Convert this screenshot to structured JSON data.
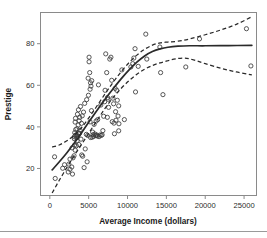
{
  "chart_data": {
    "type": "scatter",
    "title": "",
    "xlabel": "Average Income (dollars)",
    "ylabel": "Prestige",
    "xlim": [
      -1200,
      26600
    ],
    "ylim": [
      7,
      95
    ],
    "xticks": [
      0,
      5000,
      10000,
      15000,
      20000,
      25000
    ],
    "xtick_labels": [
      "0",
      "5000",
      "10000",
      "15000",
      "20000",
      "25000"
    ],
    "yticks": [
      20,
      40,
      60,
      80
    ],
    "ytick_labels": [
      "20",
      "40",
      "60",
      "80"
    ],
    "grid": false,
    "legend": "none",
    "marker": "open-circle",
    "point_color": "#3a3a3a",
    "fit_color": "#2a2a2a",
    "band_color": "#2a2a2a",
    "frame_color": "#8a8a8a",
    "points": [
      [
        611,
        25.6
      ],
      [
        693,
        15.2
      ],
      [
        1656,
        20.1
      ],
      [
        1890,
        21.8
      ],
      [
        2370,
        18.3
      ],
      [
        2448,
        22.1
      ],
      [
        2594,
        24.5
      ],
      [
        2594,
        19.6
      ],
      [
        2827,
        20.7
      ],
      [
        2865,
        29.9
      ],
      [
        2918,
        17.3
      ],
      [
        2987,
        25.1
      ],
      [
        3116,
        26.1
      ],
      [
        3148,
        34.3
      ],
      [
        3161,
        35.2
      ],
      [
        3179,
        31.2
      ],
      [
        3203,
        37.2
      ],
      [
        3254,
        42.3
      ],
      [
        3263,
        28.8
      ],
      [
        3271,
        35.9
      ],
      [
        3302,
        44.1
      ],
      [
        3333,
        38.7
      ],
      [
        3409,
        36.2
      ],
      [
        3424,
        30.9
      ],
      [
        3456,
        34.8
      ],
      [
        3485,
        39.1
      ],
      [
        3511,
        33.3
      ],
      [
        3554,
        46.1
      ],
      [
        3617,
        35.6
      ],
      [
        3650,
        40.9
      ],
      [
        3685,
        48.2
      ],
      [
        3703,
        37.1
      ],
      [
        3739,
        31.5
      ],
      [
        3781,
        42.9
      ],
      [
        3821,
        36.8
      ],
      [
        3855,
        44.6
      ],
      [
        3891,
        38.4
      ],
      [
        3947,
        49.8
      ],
      [
        4011,
        34.1
      ],
      [
        4075,
        41.7
      ],
      [
        4105,
        26.5
      ],
      [
        4168,
        45.3
      ],
      [
        4229,
        25.9
      ],
      [
        4337,
        47.1
      ],
      [
        4411,
        20.4
      ],
      [
        4484,
        51.3
      ],
      [
        4557,
        29.4
      ],
      [
        4696,
        36.4
      ],
      [
        4741,
        53.1
      ],
      [
        4800,
        23.2
      ],
      [
        4867,
        35.9
      ],
      [
        4930,
        63.4
      ],
      [
        4970,
        55.2
      ],
      [
        5052,
        73.5
      ],
      [
        5052,
        71.3
      ],
      [
        5134,
        66.1
      ],
      [
        5180,
        42.4
      ],
      [
        5181,
        58.1
      ],
      [
        5234,
        61.2
      ],
      [
        5241,
        34.9
      ],
      [
        5299,
        59.6
      ],
      [
        5360,
        47.8
      ],
      [
        5397,
        62.2
      ],
      [
        5449,
        35.0
      ],
      [
        5511,
        37.5
      ],
      [
        5562,
        36.2
      ],
      [
        5620,
        35.4
      ],
      [
        5700,
        41.2
      ],
      [
        5795,
        36.6
      ],
      [
        5902,
        35.8
      ],
      [
        5959,
        42.8
      ],
      [
        6035,
        36.1
      ],
      [
        6112,
        35.6
      ],
      [
        6162,
        43.5
      ],
      [
        6259,
        60.2
      ],
      [
        6336,
        35.3
      ],
      [
        6462,
        36.1
      ],
      [
        6565,
        50.5
      ],
      [
        6620,
        35.9
      ],
      [
        6729,
        36.2
      ],
      [
        6825,
        38.2
      ],
      [
        6928,
        45.1
      ],
      [
        7059,
        52.1
      ],
      [
        7112,
        57.6
      ],
      [
        7196,
        75.1
      ],
      [
        7318,
        66.1
      ],
      [
        7405,
        44.6
      ],
      [
        7424,
        54.1
      ],
      [
        7482,
        53.3
      ],
      [
        7562,
        49.4
      ],
      [
        7716,
        72.6
      ],
      [
        7863,
        73.5
      ],
      [
        7962,
        62.4
      ],
      [
        8034,
        42.5
      ],
      [
        8121,
        53.8
      ],
      [
        8206,
        51.1
      ],
      [
        8258,
        41.8
      ],
      [
        8316,
        36.7
      ],
      [
        8403,
        58.5
      ],
      [
        8461,
        47.3
      ],
      [
        8516,
        43.2
      ],
      [
        8618,
        57.6
      ],
      [
        8683,
        52.8
      ],
      [
        8780,
        45.2
      ],
      [
        8865,
        38.1
      ],
      [
        8865,
        50.1
      ],
      [
        8895,
        41.5
      ],
      [
        9271,
        67.4
      ],
      [
        9593,
        43.5
      ],
      [
        10432,
        68.8
      ],
      [
        10672,
        70.4
      ],
      [
        10813,
        73.1
      ],
      [
        10966,
        77.6
      ],
      [
        11030,
        56.8
      ],
      [
        11377,
        69.1
      ],
      [
        12351,
        84.6
      ],
      [
        12480,
        72.6
      ],
      [
        14163,
        78.4
      ],
      [
        14258,
        66.1
      ],
      [
        14558,
        55.5
      ],
      [
        17498,
        68.8
      ],
      [
        19263,
        82.3
      ],
      [
        25308,
        87.2
      ],
      [
        25879,
        69.3
      ]
    ],
    "fit_curve": [
      [
        300,
        19.3
      ],
      [
        1200,
        23.1
      ],
      [
        2200,
        27.6
      ],
      [
        3200,
        32.5
      ],
      [
        4200,
        37.8
      ],
      [
        5200,
        43.3
      ],
      [
        6200,
        48.6
      ],
      [
        7200,
        53.8
      ],
      [
        8200,
        58.6
      ],
      [
        9200,
        63.2
      ],
      [
        10200,
        67.4
      ],
      [
        11200,
        71.1
      ],
      [
        12200,
        74.1
      ],
      [
        13200,
        76.2
      ],
      [
        14200,
        77.5
      ],
      [
        15200,
        78.3
      ],
      [
        16500,
        78.8
      ],
      [
        18000,
        79.0
      ],
      [
        20000,
        79.0
      ],
      [
        23000,
        79.1
      ],
      [
        26000,
        79.2
      ]
    ],
    "upper_band": [
      [
        300,
        30.3
      ],
      [
        1200,
        31.3
      ],
      [
        2200,
        33.3
      ],
      [
        3200,
        36.2
      ],
      [
        4200,
        40.2
      ],
      [
        5200,
        45.3
      ],
      [
        6200,
        50.8
      ],
      [
        7200,
        56.4
      ],
      [
        8200,
        61.7
      ],
      [
        9200,
        66.6
      ],
      [
        10200,
        70.9
      ],
      [
        11200,
        74.5
      ],
      [
        12200,
        77.3
      ],
      [
        13200,
        79.3
      ],
      [
        14200,
        80.4
      ],
      [
        15200,
        80.8
      ],
      [
        16500,
        81.2
      ],
      [
        18000,
        82.3
      ],
      [
        20000,
        84.3
      ],
      [
        22000,
        86.6
      ],
      [
        24000,
        89.3
      ],
      [
        26000,
        93.0
      ]
    ],
    "lower_band": [
      [
        300,
        8.2
      ],
      [
        1200,
        14.2
      ],
      [
        2200,
        20.5
      ],
      [
        3200,
        26.5
      ],
      [
        4200,
        32.2
      ],
      [
        5200,
        38.1
      ],
      [
        6200,
        43.8
      ],
      [
        7200,
        49.4
      ],
      [
        8200,
        54.3
      ],
      [
        9200,
        58.6
      ],
      [
        10200,
        62.2
      ],
      [
        11200,
        65.3
      ],
      [
        12200,
        67.7
      ],
      [
        13200,
        69.5
      ],
      [
        14200,
        70.8
      ],
      [
        15200,
        71.8
      ],
      [
        16200,
        72.7
      ],
      [
        17400,
        73.1
      ],
      [
        18600,
        72.1
      ],
      [
        20000,
        70.4
      ],
      [
        22000,
        68.2
      ],
      [
        24000,
        66.4
      ],
      [
        26000,
        65.0
      ]
    ]
  }
}
